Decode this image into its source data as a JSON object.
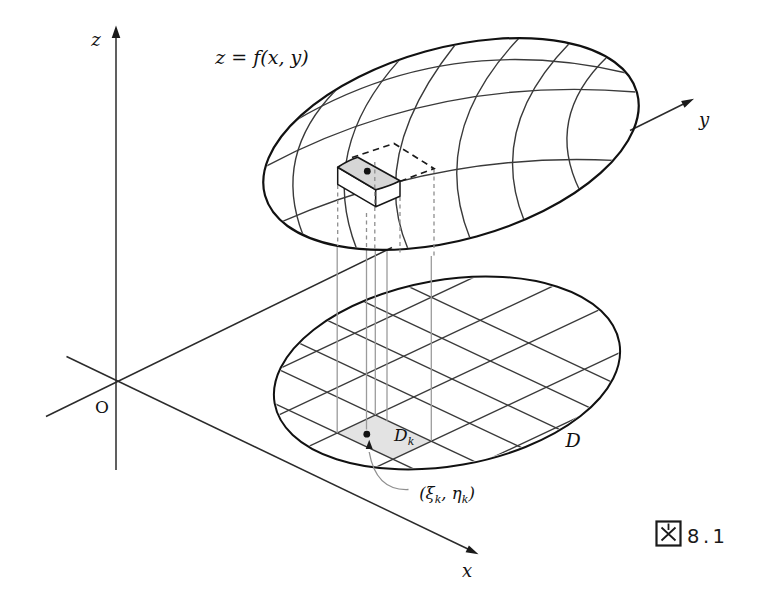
{
  "figure": {
    "surface_label": "z = f(x, y)",
    "axes": {
      "z": "z",
      "y": "y",
      "x": "x",
      "origin": "O"
    },
    "region_label": "D",
    "cell_label": {
      "full": "Dk",
      "main": "D",
      "sub": "k"
    },
    "sample_point_label": {
      "full": "(ξk, ηk)",
      "p1": "(ξ",
      "s1": "k",
      "p2": ", η",
      "s2": "k",
      "p3": ")"
    },
    "caption": {
      "full": "図 8.1",
      "kanji": "図",
      "number": "8.1"
    },
    "colors": {
      "line": "#2b2b2b",
      "grid": "#3a3a3a",
      "projection_line": "#9b9b9b",
      "dome_dark_end": "#a5a5a5",
      "dome_light": "#f5f5f5",
      "cell_fill": "#e3e3e3",
      "patch_fill": "#d6d6d6",
      "background": "#ffffff"
    }
  }
}
